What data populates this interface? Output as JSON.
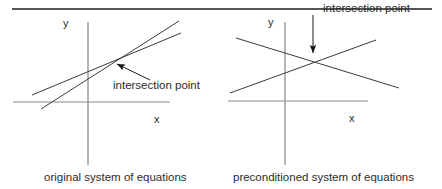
{
  "figure": {
    "background_color": "#ffffff",
    "ink_color": "#2b2b2b",
    "axis_color": "#6e6e6e",
    "line_color": "#3a3a3a",
    "top_rule": {
      "x1": 12,
      "x2": 432,
      "y": 9
    }
  },
  "panels": [
    {
      "id": "original",
      "caption": "original system of equations",
      "axis_labels": {
        "y": "y",
        "x": "x"
      },
      "callout": "intersection point",
      "axes": {
        "y_axis": {
          "x": 88,
          "y1": 22,
          "y2": 165
        },
        "x_axis": {
          "y": 102,
          "x1": 13,
          "x2": 170
        }
      },
      "lines": [
        {
          "name": "equation-line-1",
          "x1": 32,
          "y1": 95,
          "x2": 181,
          "y2": 33
        },
        {
          "name": "equation-line-2",
          "x1": 41,
          "y1": 109,
          "x2": 179,
          "y2": 21
        }
      ],
      "intersection": {
        "x": 112,
        "y": 62
      },
      "arrow": {
        "from_x": 150,
        "from_y": 80,
        "to_x": 114,
        "to_y": 63
      }
    },
    {
      "id": "preconditioned",
      "caption": "preconditioned system of equations",
      "axis_labels": {
        "y": "y",
        "x": "x"
      },
      "callout": "intersection point",
      "axes": {
        "y_axis": {
          "x": 285,
          "y1": 22,
          "y2": 165
        },
        "x_axis": {
          "y": 101,
          "x1": 228,
          "x2": 368
        }
      },
      "lines": [
        {
          "name": "equation-line-1",
          "x1": 236,
          "y1": 38,
          "x2": 399,
          "y2": 88
        },
        {
          "name": "equation-line-2",
          "x1": 230,
          "y1": 93,
          "x2": 376,
          "y2": 40
        }
      ],
      "intersection": {
        "x": 313,
        "y": 58
      },
      "arrow": {
        "from_x": 313,
        "from_y": 15,
        "to_x": 313,
        "to_y": 57
      }
    }
  ]
}
